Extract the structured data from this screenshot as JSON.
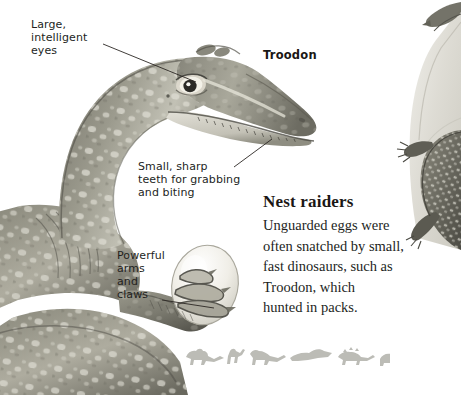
{
  "page": {
    "width": 461,
    "height": 395,
    "background_color": "#ffffff",
    "ink_color": "#231f1d"
  },
  "subject_label": {
    "name": "troodon-label",
    "text": "Troodon"
  },
  "callouts": [
    {
      "name": "callout-eyes",
      "text": "Large,\nintelligent\neyes",
      "leader_from": [
        103,
        44
      ],
      "leader_to": [
        196,
        82
      ]
    },
    {
      "name": "callout-teeth",
      "text": "Small, sharp\nteeth for grabbing\nand biting",
      "leader_from": [
        234,
        168
      ],
      "leader_to": [
        272,
        138
      ]
    },
    {
      "name": "callout-arms",
      "text": "Powerful\narms\nand\nclaws",
      "leader_from": [
        162,
        300
      ],
      "leader_to": [
        212,
        307
      ]
    }
  ],
  "article": {
    "heading": "Nest raiders",
    "body": "Unguarded eggs were\noften snatched by small,\nfast dinosaurs, such as\nTroodon, which\nhunted in packs."
  },
  "illustrations": {
    "main": {
      "name": "troodon-head-and-body-illustration",
      "description": "Troodon head, curved neck and arm grasping a large egg",
      "skin_color": "#8e8d80",
      "skin_highlight": "#d9d8cd",
      "skin_shadow": "#5f5e54",
      "egg_color": "#eceae3"
    },
    "edge": {
      "name": "climbing-dinosaur-edge-illustration",
      "description": "Partially cropped dinosaur climbing a rock at the right edge",
      "rock_color": "#d6d4cb",
      "body_color": "#6f6e64"
    },
    "frieze": {
      "name": "dinosaur-silhouette-frieze",
      "description": "Row of small grey dinosaur silhouettes",
      "color": "#b9b9b4",
      "count": 8,
      "silhouettes": [
        "ceratopsian",
        "theropod-running",
        "theropod-walking",
        "pterosaur",
        "ankylosaur",
        "sauropod",
        "theropod-small",
        "theropod-partial"
      ]
    }
  }
}
